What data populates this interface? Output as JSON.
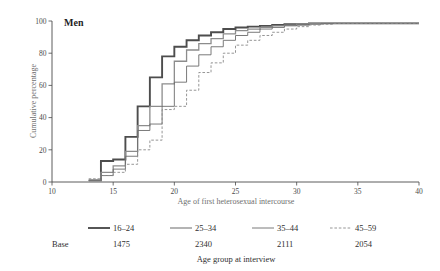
{
  "figure": {
    "panel_title": "Men",
    "background": "#ffffff"
  },
  "chart_data": {
    "type": "line",
    "title": "Men",
    "xlabel": "Age of first heterosexual intercourse",
    "ylabel": "Cumulative percentage",
    "xlim": [
      10,
      40
    ],
    "ylim": [
      0,
      100
    ],
    "xticks": [
      10,
      15,
      20,
      25,
      30,
      35,
      40
    ],
    "xtick_labels": [
      "10",
      "15",
      "20",
      "25",
      "30",
      "35",
      "40"
    ],
    "yticks": [
      0,
      20,
      40,
      60,
      80,
      100
    ],
    "ytick_labels": [
      "0",
      "20",
      "40",
      "60",
      "80",
      "100"
    ],
    "grid": false,
    "legend_position": "below",
    "step_style": "post",
    "x": [
      13,
      14,
      15,
      16,
      17,
      18,
      19,
      20,
      21,
      22,
      23,
      24,
      25,
      26,
      27,
      28,
      29,
      30,
      31,
      32,
      33,
      34,
      35,
      36,
      37,
      38,
      39,
      40
    ],
    "series": [
      {
        "name": "16-24",
        "label": "16–24",
        "base": "1475",
        "color": "#4d4d4d",
        "linestyle": "solid",
        "linewidth": 1.9,
        "values": [
          1,
          13,
          14,
          28,
          47,
          65,
          78,
          84,
          88,
          91,
          93,
          95,
          96,
          96.5,
          97,
          97.5,
          98,
          98,
          98.5,
          98.5,
          98.5,
          98.5,
          98.5,
          98.5,
          98.5,
          98.5,
          98.5,
          98.5
        ]
      },
      {
        "name": "25-34",
        "label": "25–34",
        "base": "2340",
        "color": "#8c8c8c",
        "linestyle": "solid",
        "linewidth": 1.3,
        "values": [
          1,
          6,
          10,
          19,
          35,
          47,
          61,
          75,
          82,
          86,
          89,
          92,
          94,
          95,
          96,
          97,
          97.5,
          98,
          98.5,
          98.5,
          98.5,
          98.5,
          98.5,
          98.5,
          98.5,
          98.5,
          98.5,
          98.5
        ]
      },
      {
        "name": "35-44",
        "label": "35–44",
        "base": "2111",
        "color": "#6b6b6b",
        "linestyle": "solid",
        "linewidth": 0.9,
        "values": [
          1,
          4,
          8,
          16,
          32,
          36,
          47,
          62,
          72,
          79,
          84,
          88,
          91,
          93,
          95,
          96,
          97,
          97.5,
          98,
          98.5,
          98.5,
          98.5,
          98.5,
          98.5,
          98.5,
          98.5,
          98.5,
          98.5
        ]
      },
      {
        "name": "45-59",
        "label": "45–59",
        "base": "2054",
        "color": "#8a8a8a",
        "linestyle": "dashed",
        "linewidth": 0.9,
        "values": [
          2,
          4,
          6,
          11,
          20,
          26,
          45,
          47,
          57,
          68,
          74,
          80,
          85,
          88,
          91,
          93,
          95,
          96.5,
          97.5,
          98,
          98.5,
          98.5,
          98.5,
          98.5,
          98.5,
          98.5,
          98.5,
          98.5
        ]
      }
    ]
  },
  "legend": {
    "base_label": "Base",
    "caption": "Age group at interview",
    "entries": [
      {
        "label": "16–24",
        "base": "1475"
      },
      {
        "label": "25–34",
        "base": "2340"
      },
      {
        "label": "35–44",
        "base": "2111"
      },
      {
        "label": "45–59",
        "base": "2054"
      }
    ]
  }
}
